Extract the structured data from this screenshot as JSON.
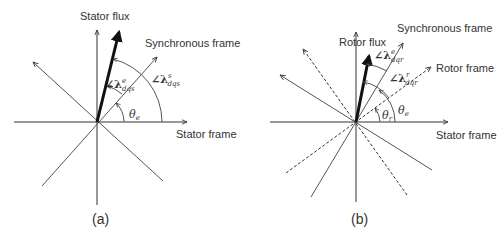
{
  "panel_a": {
    "caption": "(a)",
    "labels": {
      "flux": "Stator flux",
      "sync": "Synchronous frame",
      "stator": "Stator frame"
    },
    "angles": {
      "theta": "θ",
      "theta_sub": "e",
      "lambda_e": "∠λ",
      "lambda_e_sup": "e",
      "lambda_e_sub": "dqs",
      "lambda_s": "∠λ",
      "lambda_s_sup": "s",
      "lambda_s_sub": "dqs"
    }
  },
  "panel_b": {
    "caption": "(b)",
    "labels": {
      "flux": "Rotor flux",
      "sync": "Synchronous frame",
      "rotor": "Rotor frame",
      "stator": "Stator frame"
    },
    "angles": {
      "theta_r": "θ",
      "theta_r_sub": "r",
      "theta_e": "θ",
      "theta_e_sub": "e",
      "lambda_e": "∠λ",
      "lambda_e_sup": "e",
      "lambda_e_sub": "dqr",
      "lambda_r": "∠λ",
      "lambda_r_sup": "r",
      "lambda_r_sub": "dqr"
    }
  }
}
